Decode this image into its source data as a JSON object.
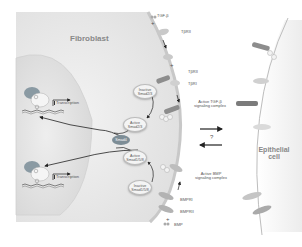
{
  "diagram": {
    "cells": {
      "fibroblast": "Fibroblast",
      "epithelial": "Epithelial cell"
    },
    "ligands": {
      "tgf": "TGF-β",
      "bmp": "BMP"
    },
    "receptors": {
      "tbrii_top": "TβRII",
      "tbrii": "TβRII",
      "tbri": "TβRI",
      "bmpri": "BMPRI",
      "bmprii": "BMPRII"
    },
    "complexes": {
      "tgf_active": "Active TGF-β signaling complex",
      "bmp_active": "Active BMP signaling complex"
    },
    "smads": {
      "inactive_23": "Inactive Smad2/3",
      "active_23": "Active Smad2/3",
      "smad4": "Smad4",
      "active_158": "Active Smad1/5/8",
      "inactive_158": "Inactive Smad1/5/8"
    },
    "nucleus": {
      "transcription_top": "Transcription",
      "transcription_bottom": "Transcription"
    },
    "symbols": {
      "plus": "+",
      "question": "?"
    }
  }
}
